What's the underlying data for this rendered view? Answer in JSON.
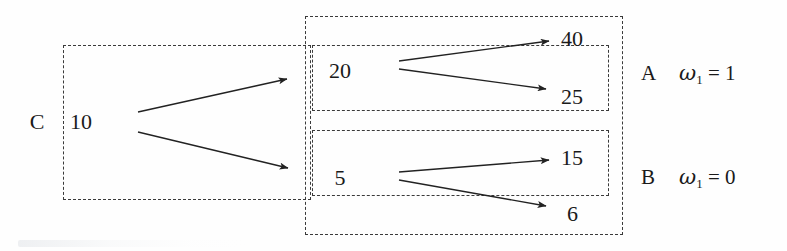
{
  "figure": {
    "background_color": "#fefefe",
    "line_color": "#3a3a3a",
    "text_color": "#1a1a1a"
  },
  "root": {
    "player_label": "C",
    "value": "10"
  },
  "stage2": {
    "upper_value": "20",
    "lower_value": "5"
  },
  "outcomes": {
    "a_upper": "40",
    "a_lower": "25",
    "b_upper": "15",
    "b_lower": "6"
  },
  "information_sets": [
    {
      "letter": "A",
      "omega": "ω",
      "subscript": "1",
      "equals": "=",
      "value": "1",
      "full": "A  ω₁ = 1"
    },
    {
      "letter": "B",
      "omega": "ω",
      "subscript": "1",
      "equals": "=",
      "value": "0",
      "full": "B  ω₁ = 0"
    }
  ],
  "edges": [
    {
      "name": "root-to-upper",
      "from": "10",
      "to": "20"
    },
    {
      "name": "root-to-lower",
      "from": "10",
      "to": "5"
    },
    {
      "name": "upper-to-40",
      "from": "20",
      "to": "40"
    },
    {
      "name": "upper-to-25",
      "from": "20",
      "to": "25"
    },
    {
      "name": "lower-to-15",
      "from": "5",
      "to": "15"
    },
    {
      "name": "lower-to-6",
      "from": "5",
      "to": "6"
    }
  ]
}
